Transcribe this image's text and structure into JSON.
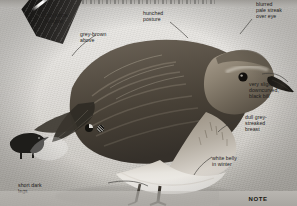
{
  "page": {
    "title_strip": "",
    "background_color": "#d8d6d2"
  },
  "illustration": {
    "subject": "winter-plumage sandpiper, side profile",
    "silhouette_label": "standing-sandpiper-silhouette",
    "ghost_label": "pale-flying-sandpiper-silhouette"
  },
  "annotations": [
    {
      "id": "wingbar",
      "text": "thin white\nwingbar"
    },
    {
      "id": "upperparts",
      "text": "grey-brown\nabove"
    },
    {
      "id": "posture",
      "text": "hunched\nposture"
    },
    {
      "id": "eyestripe",
      "text": "blurred\npale streak\nover eye"
    },
    {
      "id": "bill",
      "text": "very slightly\ndowncurved,\nblack bill"
    },
    {
      "id": "breast",
      "text": "dull grey-\nstreaked\nbreast"
    },
    {
      "id": "belly",
      "text": "white belly\nin winter"
    },
    {
      "id": "legs",
      "text": "short dark\nlegs"
    }
  ],
  "icons": [
    {
      "id": "icon-pie",
      "name": "pie-circle-icon"
    },
    {
      "id": "icon-hatch",
      "name": "hatched-circle-icon"
    }
  ],
  "note_bar": {
    "label": "NOTE",
    "background": "#b0ada8"
  },
  "colors": {
    "text": "#1d1c1a",
    "leader_line": "#3d3b38",
    "plumage_dark": "#4a443c",
    "plumage_light": "#e8e6e2"
  }
}
